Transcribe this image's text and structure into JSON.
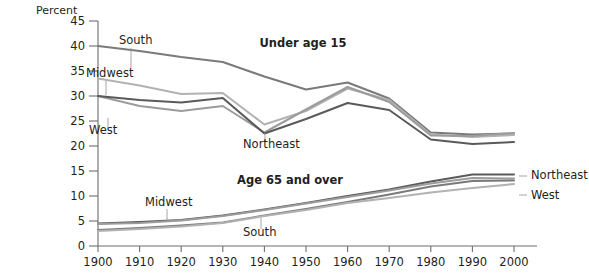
{
  "chart_data": {
    "type": "line",
    "title": "",
    "xlabel": "",
    "ylabel": "Percent",
    "ylim": [
      0,
      45
    ],
    "xlim": [
      1900,
      2000
    ],
    "grid": false,
    "legend_position": "inline-annotations",
    "x": [
      1900,
      1910,
      1920,
      1930,
      1940,
      1950,
      1960,
      1970,
      1980,
      1990,
      2000
    ],
    "y_ticks": [
      0,
      5,
      10,
      15,
      20,
      25,
      30,
      35,
      40,
      45
    ],
    "x_ticks": [
      1900,
      1910,
      1920,
      1930,
      1940,
      1950,
      1960,
      1970,
      1980,
      1990,
      2000
    ],
    "panels": [
      {
        "name": "Under age 15",
        "title": "Under age 15",
        "series": [
          {
            "name": "South",
            "color": "#7a7a7a",
            "values": [
              40.0,
              39.0,
              37.8,
              36.8,
              33.9,
              31.3,
              32.7,
              29.5,
              22.7,
              22.3,
              22.5
            ]
          },
          {
            "name": "Midwest",
            "color": "#b2b2b2",
            "values": [
              33.5,
              32.1,
              30.4,
              30.6,
              24.3,
              27.0,
              31.5,
              29.2,
              22.3,
              21.8,
              22.2
            ]
          },
          {
            "name": "West",
            "color": "#9c9c9c",
            "values": [
              30.0,
              28.0,
              27.0,
              28.0,
              22.7,
              27.3,
              31.8,
              28.8,
              22.1,
              22.0,
              22.6
            ]
          },
          {
            "name": "Northeast",
            "color": "#5a5a5a",
            "values": [
              30.0,
              29.2,
              28.7,
              29.6,
              22.5,
              25.4,
              28.6,
              27.2,
              21.3,
              20.4,
              20.8
            ]
          }
        ]
      },
      {
        "name": "Age 65 and over",
        "title": "Age 65 and over",
        "series": [
          {
            "name": "Northeast",
            "color": "#5a5a5a",
            "values": [
              4.5,
              4.8,
              5.2,
              6.1,
              7.3,
              8.6,
              10.0,
              11.3,
              12.9,
              14.3,
              14.3
            ]
          },
          {
            "name": "Midwest",
            "color": "#9c9c9c",
            "values": [
              4.4,
              4.6,
              5.1,
              6.0,
              7.2,
              8.5,
              9.8,
              11.1,
              12.5,
              13.6,
              13.5
            ]
          },
          {
            "name": "South",
            "color": "#7a7a7a",
            "values": [
              3.2,
              3.6,
              4.1,
              4.7,
              6.1,
              7.4,
              8.8,
              10.3,
              11.9,
              13.0,
              13.1
            ]
          },
          {
            "name": "West",
            "color": "#b2b2b2",
            "values": [
              3.0,
              3.4,
              3.9,
              4.6,
              6.0,
              7.2,
              8.6,
              9.6,
              10.7,
              11.6,
              12.4
            ]
          }
        ]
      }
    ],
    "annotations": [
      {
        "text": "South",
        "x": 119,
        "y": 44,
        "leader": {
          "x1": 131,
          "y1": 48,
          "x2": 131,
          "y2": 68
        }
      },
      {
        "text": "Midwest",
        "x": 86,
        "y": 77,
        "leader": {
          "x1": 106,
          "y1": 81,
          "x2": 106,
          "y2": 95
        }
      },
      {
        "text": "West",
        "x": 89,
        "y": 134,
        "leader": {
          "x1": 108,
          "y1": 118,
          "x2": 108,
          "y2": 128
        }
      },
      {
        "text": "Northeast",
        "x": 243,
        "y": 148,
        "leader": {
          "x1": 265,
          "y1": 133,
          "x2": 265,
          "y2": 142
        }
      },
      {
        "text": "Midwest",
        "x": 145,
        "y": 206,
        "leader": {
          "x1": 167,
          "y1": 209,
          "x2": 167,
          "y2": 222
        }
      },
      {
        "text": "South",
        "x": 243,
        "y": 236,
        "leader": {
          "x1": 261,
          "y1": 218,
          "x2": 261,
          "y2": 229
        }
      },
      {
        "text": "Northeast",
        "x": 531,
        "y": 179,
        "leader": {
          "x1": 519,
          "y1": 176,
          "x2": 527,
          "y2": 176
        }
      },
      {
        "text": "West",
        "x": 531,
        "y": 199,
        "leader": {
          "x1": 519,
          "y1": 195,
          "x2": 527,
          "y2": 195
        }
      }
    ],
    "panel_titles": [
      {
        "text": "Under age 15",
        "x": 303,
        "y": 47
      },
      {
        "text": "Age 65 and over",
        "x": 290,
        "y": 184
      }
    ],
    "colors": {
      "northeast": "#5a5a5a",
      "midwest": "#9c9c9c",
      "south": "#7a7a7a",
      "west": "#b2b2b2",
      "axis": "#6e6e6e",
      "text": "#231f20",
      "background": "#ffffff"
    }
  }
}
